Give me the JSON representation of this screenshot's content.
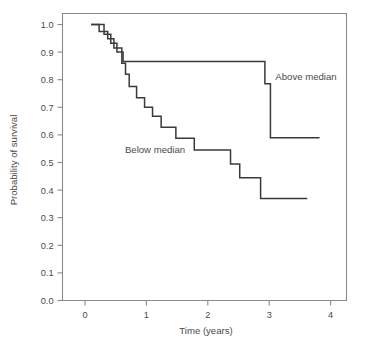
{
  "chart_data": {
    "type": "line",
    "subtype": "kaplan-meier-step",
    "title": "",
    "xlabel": "Time (years)",
    "ylabel": "Probability of survival",
    "xlim": [
      -0.33,
      4.45
    ],
    "ylim": [
      0.0,
      1.04
    ],
    "xticks": [
      0,
      1,
      2,
      3,
      4
    ],
    "xtick_labels": [
      "0",
      "1",
      "2",
      "3",
      "4"
    ],
    "yticks": [
      0.0,
      0.1,
      0.2,
      0.3,
      0.4,
      0.5,
      0.6,
      0.7,
      0.8,
      0.9,
      1.0
    ],
    "ytick_labels": [
      "0.0",
      "0.1",
      "0.2",
      "0.3",
      "0.4",
      "0.5",
      "0.6",
      "0.7",
      "0.8",
      "0.9",
      "1.0"
    ],
    "grid": false,
    "legend": "inline-annotations",
    "line_color": "#3a3a3a",
    "axis_color": "#8a8a8a",
    "series": [
      {
        "name": "Above median",
        "label": "Above median",
        "label_x": 3.1,
        "label_y": 0.8,
        "steps_x": [
          0.1,
          0.31,
          0.31,
          0.42,
          0.42,
          0.52,
          0.52,
          0.62,
          0.62,
          0.78,
          0.78,
          2.93,
          2.93,
          3.02,
          3.02,
          3.82
        ],
        "steps_y": [
          1.0,
          1.0,
          0.965,
          0.965,
          0.932,
          0.932,
          0.9,
          0.9,
          0.866,
          0.866,
          0.866,
          0.866,
          0.785,
          0.785,
          0.59,
          0.59
        ]
      },
      {
        "name": "Below median",
        "label": "Below median",
        "label_x": 0.65,
        "label_y": 0.535,
        "steps_x": [
          0.1,
          0.23,
          0.23,
          0.37,
          0.37,
          0.47,
          0.47,
          0.6,
          0.6,
          0.66,
          0.66,
          0.72,
          0.72,
          0.84,
          0.84,
          0.97,
          0.97,
          1.1,
          1.1,
          1.24,
          1.24,
          1.48,
          1.48,
          1.78,
          1.78,
          2.37,
          2.37,
          2.52,
          2.52,
          2.86,
          2.86,
          3.62
        ],
        "steps_y": [
          1.0,
          1.0,
          0.975,
          0.975,
          0.948,
          0.948,
          0.915,
          0.915,
          0.86,
          0.86,
          0.82,
          0.82,
          0.775,
          0.775,
          0.735,
          0.735,
          0.7,
          0.7,
          0.668,
          0.668,
          0.628,
          0.628,
          0.588,
          0.588,
          0.545,
          0.545,
          0.495,
          0.495,
          0.445,
          0.445,
          0.37,
          0.37
        ]
      }
    ]
  }
}
